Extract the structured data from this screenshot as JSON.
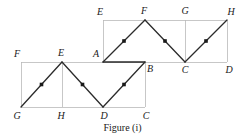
{
  "figure": {
    "caption": "Figure (i)",
    "colors": {
      "grid_line": "#b9b9b9",
      "path_line": "#2b2b2b",
      "marker": "#1a1a1a",
      "label_text": "#1a1a1a",
      "background": "#ffffff"
    },
    "geometry": {
      "lower_rectangle": {
        "x": 21,
        "y": 62,
        "width": 124,
        "height": 45
      },
      "upper_rectangle": {
        "x": 103,
        "y": 20,
        "width": 124,
        "height": 42
      },
      "lower_divider_x": 62,
      "upper_divider_x": 185
    },
    "vertices": [
      {
        "id": "F-lower",
        "letter": "F",
        "x": 21,
        "y": 62,
        "label_x": 17,
        "label_y": 54
      },
      {
        "id": "G-lower",
        "letter": "G",
        "x": 21,
        "y": 107,
        "label_x": 17,
        "label_y": 116
      },
      {
        "id": "E-lower",
        "letter": "E",
        "x": 62,
        "y": 62,
        "label_x": 61,
        "label_y": 53
      },
      {
        "id": "H-lower",
        "letter": "H",
        "x": 62,
        "y": 107,
        "label_x": 61,
        "label_y": 116
      },
      {
        "id": "D",
        "letter": "D",
        "x": 103,
        "y": 107,
        "label_x": 104,
        "label_y": 116
      },
      {
        "id": "C-lower",
        "letter": "C",
        "x": 145,
        "y": 107,
        "label_x": 146,
        "label_y": 116
      },
      {
        "id": "A",
        "letter": "A",
        "x": 103,
        "y": 62,
        "label_x": 96,
        "label_y": 54
      },
      {
        "id": "B",
        "letter": "B",
        "x": 145,
        "y": 62,
        "label_x": 150,
        "label_y": 69
      },
      {
        "id": "E-upper",
        "letter": "E",
        "x": 103,
        "y": 20,
        "label_x": 100,
        "label_y": 12
      },
      {
        "id": "F-upper",
        "letter": "F",
        "x": 145,
        "y": 20,
        "label_x": 144,
        "label_y": 11
      },
      {
        "id": "G-upper",
        "letter": "G",
        "x": 185,
        "y": 20,
        "label_x": 185,
        "label_y": 11
      },
      {
        "id": "H-upper",
        "letter": "H",
        "x": 227,
        "y": 20,
        "label_x": 231,
        "label_y": 12
      },
      {
        "id": "C-upper",
        "letter": "C",
        "x": 185,
        "y": 62,
        "label_x": 185,
        "label_y": 70
      },
      {
        "id": "D-upper",
        "letter": "D",
        "x": 227,
        "y": 62,
        "label_x": 229,
        "label_y": 70
      }
    ],
    "grid_segments": [
      {
        "name": "lower-rect-top",
        "x1": 21,
        "y1": 62,
        "x2": 145,
        "y2": 62
      },
      {
        "name": "lower-rect-bottom",
        "x1": 21,
        "y1": 107,
        "x2": 145,
        "y2": 107
      },
      {
        "name": "lower-rect-left",
        "x1": 21,
        "y1": 62,
        "x2": 21,
        "y2": 107
      },
      {
        "name": "lower-rect-right",
        "x1": 145,
        "y1": 62,
        "x2": 145,
        "y2": 107
      },
      {
        "name": "lower-divider-EH",
        "x1": 62,
        "y1": 62,
        "x2": 62,
        "y2": 107
      },
      {
        "name": "upper-rect-top",
        "x1": 103,
        "y1": 20,
        "x2": 227,
        "y2": 20
      },
      {
        "name": "upper-rect-bottom",
        "x1": 103,
        "y1": 62,
        "x2": 227,
        "y2": 62
      },
      {
        "name": "upper-rect-left",
        "x1": 103,
        "y1": 20,
        "x2": 103,
        "y2": 62
      },
      {
        "name": "upper-rect-right",
        "x1": 227,
        "y1": 20,
        "x2": 227,
        "y2": 62
      },
      {
        "name": "upper-divider-GC",
        "x1": 185,
        "y1": 20,
        "x2": 185,
        "y2": 62
      }
    ],
    "zigzag_path": {
      "name": "G-E-D-B-F-C-H",
      "points": "21,107 62,62 103,107 145,62 145,62 103,62 145,20 185,62 227,20"
    },
    "path_segments": [
      {
        "name": "segment-G-E",
        "x1": 21,
        "y1": 107,
        "x2": 62,
        "y2": 62
      },
      {
        "name": "segment-E-D",
        "x1": 62,
        "y1": 62,
        "x2": 103,
        "y2": 107
      },
      {
        "name": "segment-D-B",
        "x1": 103,
        "y1": 107,
        "x2": 145,
        "y2": 62
      },
      {
        "name": "segment-A-B",
        "x1": 103,
        "y1": 62,
        "x2": 145,
        "y2": 62
      },
      {
        "name": "segment-A-F",
        "x1": 103,
        "y1": 62,
        "x2": 145,
        "y2": 20
      },
      {
        "name": "segment-F-C",
        "x1": 145,
        "y1": 20,
        "x2": 185,
        "y2": 62
      },
      {
        "name": "segment-C-H",
        "x1": 185,
        "y1": 62,
        "x2": 227,
        "y2": 20
      }
    ],
    "midpoint_markers": [
      {
        "name": "marker-GE",
        "x": 41.5,
        "y": 84.5
      },
      {
        "name": "marker-ED",
        "x": 82.5,
        "y": 84.5
      },
      {
        "name": "marker-DB",
        "x": 124,
        "y": 84.5
      },
      {
        "name": "marker-AF",
        "x": 124,
        "y": 41
      },
      {
        "name": "marker-FC",
        "x": 165,
        "y": 41
      },
      {
        "name": "marker-CH",
        "x": 206,
        "y": 41
      }
    ]
  }
}
